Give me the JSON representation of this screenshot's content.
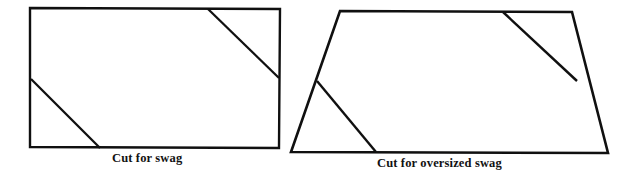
{
  "page": {
    "background_color": "#ffffff",
    "line_color": "#101010",
    "width": 629,
    "height": 175
  },
  "figures": [
    {
      "id": "swag",
      "shape": "rectangle",
      "caption": "Cut for swag",
      "outline_points": "30,8 280,9 279,148 30,147",
      "cut_lines": [
        {
          "name": "upper-right-cut",
          "x1": 208,
          "y1": 9,
          "x2": 279,
          "y2": 78
        },
        {
          "name": "lower-left-cut",
          "x1": 31,
          "y1": 79,
          "x2": 100,
          "y2": 148
        }
      ]
    },
    {
      "id": "oversized-swag",
      "shape": "trapezoid",
      "caption": "Cut for oversized swag",
      "outline_points": "340,11 572,12 608,153 291,152",
      "cut_lines": [
        {
          "name": "upper-right-cut",
          "x1": 503,
          "y1": 12,
          "x2": 577,
          "y2": 81
        },
        {
          "name": "lower-left-cut",
          "x1": 317,
          "y1": 81,
          "x2": 376,
          "y2": 152
        }
      ]
    }
  ]
}
